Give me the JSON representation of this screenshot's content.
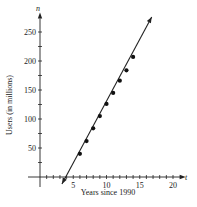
{
  "chart_data": {
    "type": "scatter",
    "title": "",
    "xlabel": "Years since 1990",
    "ylabel": "Users (in millions)",
    "x_var": "t",
    "y_var": "n",
    "xlim": [
      0,
      21
    ],
    "ylim": [
      0,
      270
    ],
    "x_ticks": [
      5,
      10,
      15,
      20
    ],
    "y_ticks": [
      50,
      100,
      150,
      200,
      250
    ],
    "x_minor_step": 1,
    "y_minor_step": 25,
    "grid": false,
    "series": [
      {
        "name": "Users",
        "type": "scatter",
        "x": [
          6,
          7,
          8,
          9,
          10,
          11,
          12,
          13,
          14
        ],
        "y": [
          40,
          62,
          84,
          105,
          126,
          145,
          166,
          184,
          207
        ]
      },
      {
        "name": "Linear fit",
        "type": "line",
        "x": [
          3.3,
          16.8
        ],
        "y": [
          -12,
          276
        ],
        "arrows": "both"
      }
    ]
  }
}
